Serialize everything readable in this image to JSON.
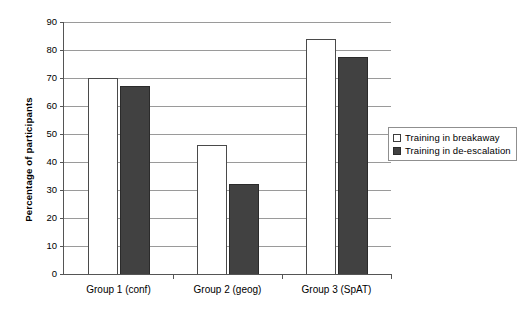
{
  "chart_data": {
    "type": "bar",
    "title": "",
    "xlabel": "",
    "ylabel": "Percentage of participants",
    "categories": [
      "Group 1 (conf)",
      "Group 2 (geog)",
      "Group 3 (SpAT)"
    ],
    "series": [
      {
        "name": "Training in breakaway",
        "values": [
          70,
          46,
          84
        ],
        "swatch": "light",
        "color": "#ffffff"
      },
      {
        "name": "Training in de-escalation",
        "values": [
          67,
          32,
          77.5
        ],
        "swatch": "dark",
        "color": "#414141"
      }
    ],
    "ylim": [
      0,
      90
    ],
    "yticks": [
      0,
      10,
      20,
      30,
      40,
      50,
      60,
      70,
      80,
      90
    ],
    "ytick_labels": [
      "0",
      "10",
      "20",
      "30",
      "40",
      "50",
      "60",
      "70",
      "80",
      "90"
    ],
    "grid": "horizontal",
    "legend_position": "right-middle"
  },
  "colors": {
    "light_bar": "#ffffff",
    "dark_bar": "#414141",
    "gridline": "#9a9a9a",
    "axis": "#555555",
    "legend_border": "#8f8f8f",
    "background": "#ffffff"
  }
}
